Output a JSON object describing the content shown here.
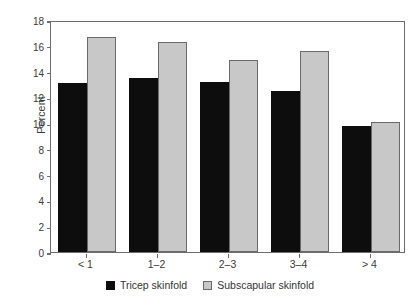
{
  "chart_data": {
    "type": "bar",
    "title": "",
    "subtitle": "",
    "xlabel": "",
    "ylabel": "Percent",
    "categories": [
      "< 1",
      "1–2",
      "2–3",
      "3–4",
      "> 4"
    ],
    "series": [
      {
        "name": "Tricep skinfold",
        "color": "#0d0d0d",
        "values": [
          13.1,
          13.5,
          13.2,
          12.5,
          9.8
        ]
      },
      {
        "name": "Subscapular skinfold",
        "color": "#c8c8c8",
        "values": [
          16.7,
          16.3,
          14.9,
          15.6,
          10.1
        ]
      }
    ],
    "ylim": [
      0,
      18
    ],
    "yticks": [
      0,
      2,
      4,
      6,
      8,
      10,
      12,
      14,
      16,
      18
    ],
    "ytick_labels": [
      "0",
      "2",
      "4",
      "6",
      "8",
      "10",
      "12",
      "14",
      "16",
      "18"
    ],
    "grid": false,
    "legend_position": "bottom-center",
    "frame": true,
    "annotations": []
  }
}
